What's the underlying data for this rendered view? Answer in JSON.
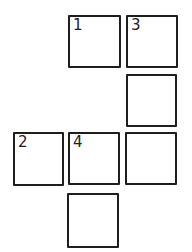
{
  "diagram": {
    "title": "",
    "stroke_color": "#1e1e1e",
    "background_color": "#ffffff",
    "boxes": [
      {
        "id": "box-1",
        "label": "1",
        "x": 68,
        "y": 15,
        "w": 53,
        "h": 53
      },
      {
        "id": "box-3",
        "label": "3",
        "x": 126,
        "y": 15,
        "w": 52,
        "h": 53
      },
      {
        "id": "box-r2c3",
        "label": "",
        "x": 126,
        "y": 74,
        "w": 51,
        "h": 53
      },
      {
        "id": "box-2",
        "label": "2",
        "x": 13,
        "y": 132,
        "w": 51,
        "h": 54
      },
      {
        "id": "box-4",
        "label": "4",
        "x": 68,
        "y": 132,
        "w": 52,
        "h": 53
      },
      {
        "id": "box-r3c3",
        "label": "",
        "x": 125,
        "y": 132,
        "w": 52,
        "h": 53
      },
      {
        "id": "box-r4c2",
        "label": "",
        "x": 67,
        "y": 193,
        "w": 52,
        "h": 55
      }
    ]
  }
}
